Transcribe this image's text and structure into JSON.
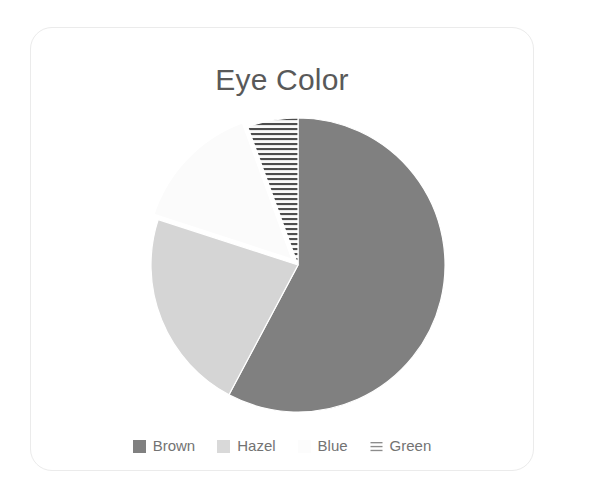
{
  "card": {
    "title": "Eye Color",
    "background": "#ffffff",
    "border_color": "#ebebeb"
  },
  "chart_data": {
    "type": "pie",
    "title": "Eye Color",
    "xlabel": "",
    "ylabel": "",
    "legend_position": "bottom",
    "grid": false,
    "start_angle_deg": 0,
    "direction": "clockwise",
    "categories": [
      "Brown",
      "Hazel",
      "Blue",
      "Green"
    ],
    "values": [
      57.8,
      22.2,
      14.4,
      5.6
    ],
    "units": "percent",
    "slices": [
      {
        "label": "Brown",
        "value": 57.8,
        "color": "#808080",
        "pattern": "solid",
        "start_deg": 0,
        "end_deg": 208,
        "exploded": false
      },
      {
        "label": "Hazel",
        "value": 22.2,
        "color": "#d5d5d5",
        "pattern": "solid",
        "start_deg": 208,
        "end_deg": 288,
        "exploded": false
      },
      {
        "label": "Blue",
        "value": 14.4,
        "color": "#fbfbfb",
        "pattern": "solid",
        "start_deg": 288,
        "end_deg": 340,
        "exploded": true
      },
      {
        "label": "Green",
        "value": 5.6,
        "color": "#fafafa",
        "pattern": "horizontal-hatch",
        "hatch_color": "#4d4d4d",
        "start_deg": 340,
        "end_deg": 360,
        "exploded": false
      }
    ]
  },
  "legend": {
    "items": [
      {
        "label": "Brown",
        "swatch": "brown-swatch-icon",
        "color": "#808080",
        "pattern": "solid"
      },
      {
        "label": "Hazel",
        "swatch": "hazel-swatch-icon",
        "color": "#d9d9d9",
        "pattern": "solid"
      },
      {
        "label": "Blue",
        "swatch": "blue-swatch-icon",
        "color": "#fcfcfc",
        "pattern": "solid"
      },
      {
        "label": "Green",
        "swatch": "green-swatch-icon",
        "color": "#ffffff",
        "pattern": "horizontal-hatch"
      }
    ]
  }
}
